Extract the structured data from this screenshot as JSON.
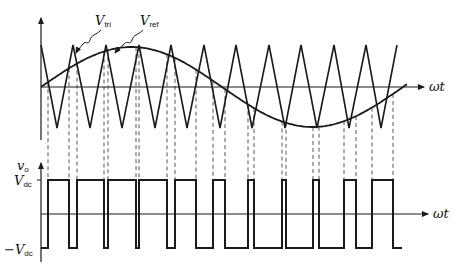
{
  "diagram": {
    "labels": {
      "v_tri": {
        "main": "V",
        "sub": "tri"
      },
      "v_ref": {
        "main": "V",
        "sub": "ref"
      },
      "omega_t_top": "ωt",
      "omega_t_bottom": "ωt",
      "v_o": {
        "main": "v",
        "sub": "o"
      },
      "v_dc": {
        "main": "V",
        "sub": "dc"
      },
      "neg_v_dc": {
        "minus": "−",
        "main": "V",
        "sub": "dc"
      }
    },
    "colors": {
      "stroke": "#1a1a1a",
      "dashed": "#444444",
      "background": "#ffffff"
    },
    "top_plot": {
      "axis_x": 41,
      "axis_top": 18,
      "zero_y": 87,
      "axis_end_x": 424,
      "tri_peak_y": 45,
      "tri_valley_y": 128,
      "tri_peaks_x": [
        41,
        73,
        106,
        139,
        171,
        204,
        236,
        269,
        301,
        334,
        366,
        397
      ],
      "tri_valleys_x": [
        57,
        90,
        122,
        155,
        187,
        220,
        252,
        285,
        317,
        349,
        381
      ],
      "ref": {
        "x_start": 41,
        "x_end": 408,
        "amplitude": 40,
        "zero_y": 87,
        "period": 362,
        "end_y": 62
      }
    },
    "bottom_plot": {
      "axis_x": 41,
      "axis_top": 163,
      "axis_bottom": 262,
      "high_y": 180,
      "zero_y": 214,
      "low_y": 248,
      "axis_end_x": 428,
      "x_start": 41,
      "x_end": 402,
      "initial_level": "low",
      "transitions_x": [
        48,
        69,
        77,
        104,
        108,
        136,
        139,
        167,
        175,
        196,
        213,
        225,
        248,
        254,
        282,
        286,
        313,
        319,
        344,
        356,
        372,
        393
      ]
    }
  }
}
